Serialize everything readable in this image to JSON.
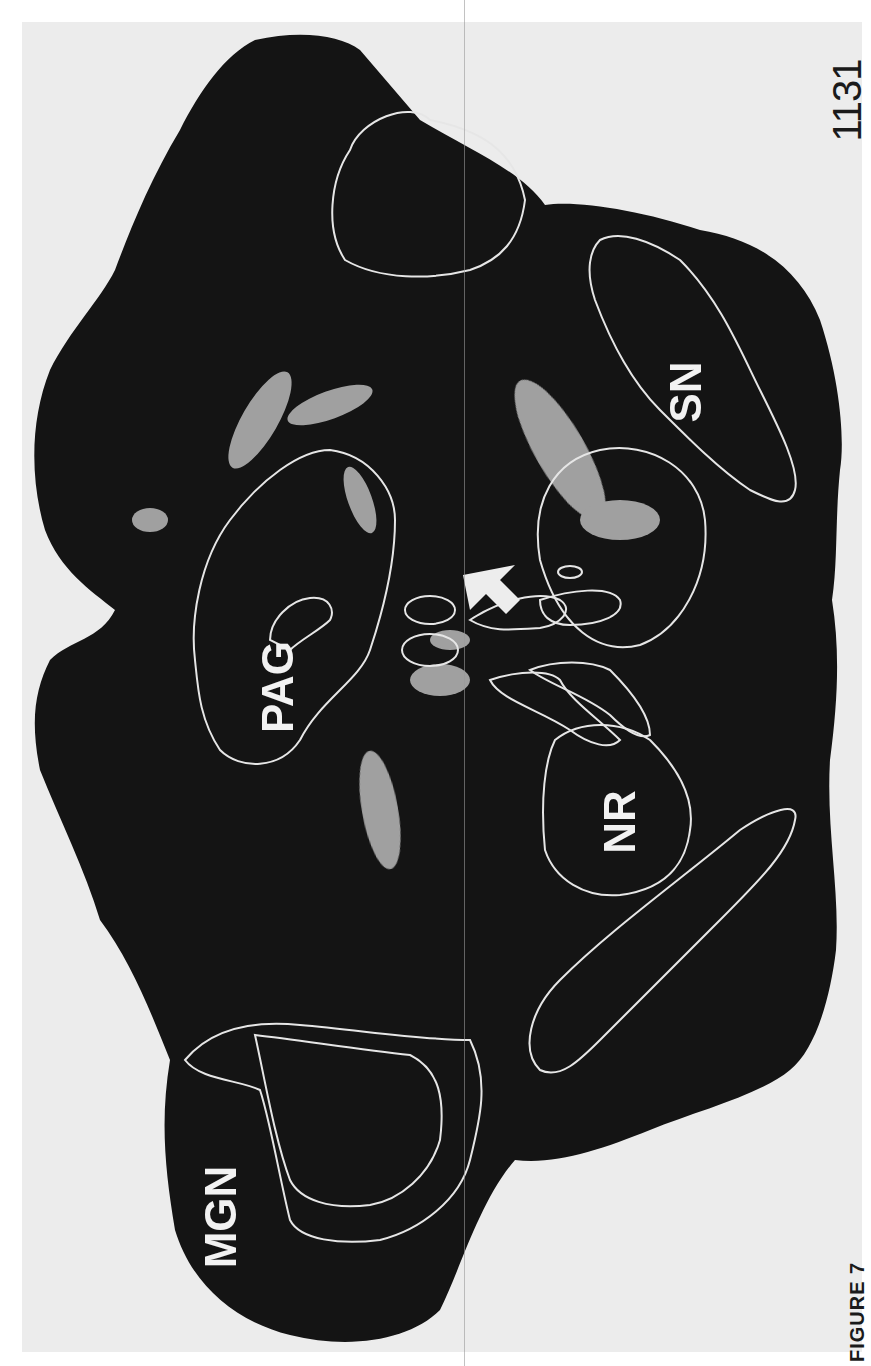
{
  "page": {
    "page_number": "1131",
    "caption_fragment": "FIGURE 7"
  },
  "figure": {
    "type": "dark-field photomicrograph of brain section (rotated 90°)",
    "labels": {
      "mgn": "MGN",
      "pag": "PAG",
      "nr": "NR",
      "sn": "SN"
    },
    "annotations": {
      "arrow": "white arrow pointing toward labeled region"
    },
    "colors": {
      "tissue": "#141414",
      "outline": "#e6e6e6",
      "label_silver": "#d9d9d9",
      "paper": "#ececec"
    }
  }
}
